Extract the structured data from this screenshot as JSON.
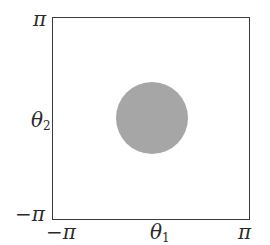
{
  "diagram": {
    "axes": {
      "x_label": "θ",
      "x_label_sub": "1",
      "y_label": "θ",
      "y_label_sub": "2",
      "x_min_label": "−π",
      "x_max_label": "π",
      "y_min_label": "−π",
      "y_max_label": "π",
      "range": [
        -3.14159,
        3.14159
      ]
    },
    "region": {
      "shape": "disc",
      "color": "#a6a6a6",
      "center_px": [
        152,
        118
      ],
      "radius_px": 36
    },
    "frame_color": "#3a3a3a"
  }
}
